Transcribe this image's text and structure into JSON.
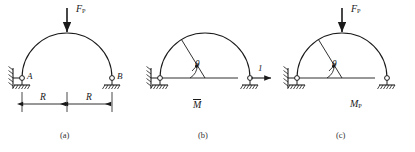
{
  "figure": {
    "stroke_color": "#1a1a1a",
    "background": "#ffffff"
  },
  "panels": [
    {
      "id": "a",
      "caption": "(a)",
      "load_label_main": "F",
      "load_label_sub": "P",
      "support_left_label": "A",
      "support_right_label": "B",
      "dimension_labels": [
        "R",
        "R"
      ],
      "notation": ""
    },
    {
      "id": "b",
      "caption": "(b)",
      "angle_label": "θ",
      "unit_load_label": "1",
      "notation_main": "M",
      "notation_sub": "",
      "notation_overbar": true
    },
    {
      "id": "c",
      "caption": "(c)",
      "load_label_main": "F",
      "load_label_sub": "P",
      "angle_label": "θ",
      "notation_main": "M",
      "notation_sub": "P",
      "notation_overbar": false
    }
  ]
}
